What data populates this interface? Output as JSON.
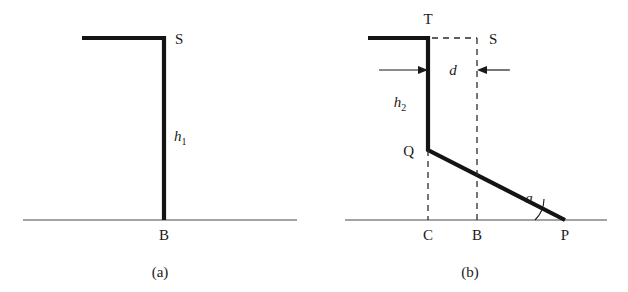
{
  "figure": {
    "background_color": "#ffffff",
    "ink_color": "#141414",
    "panels": [
      {
        "id": "a",
        "caption": "(a)",
        "points": [
          {
            "name": "S",
            "label": "S"
          },
          {
            "name": "B",
            "label": "B"
          }
        ],
        "dimensions": [
          {
            "name": "h1",
            "symbol": "h",
            "subscript": "1"
          }
        ]
      },
      {
        "id": "b",
        "caption": "(b)",
        "points": [
          {
            "name": "T",
            "label": "T"
          },
          {
            "name": "S",
            "label": "S"
          },
          {
            "name": "Q",
            "label": "Q"
          },
          {
            "name": "C",
            "label": "C"
          },
          {
            "name": "B",
            "label": "B"
          },
          {
            "name": "P",
            "label": "P"
          }
        ],
        "dimensions": [
          {
            "name": "h2",
            "symbol": "h",
            "subscript": "2"
          },
          {
            "name": "d",
            "symbol": "d",
            "subscript": ""
          }
        ],
        "angles": [
          {
            "name": "alpha",
            "symbol": "a"
          }
        ]
      }
    ]
  }
}
